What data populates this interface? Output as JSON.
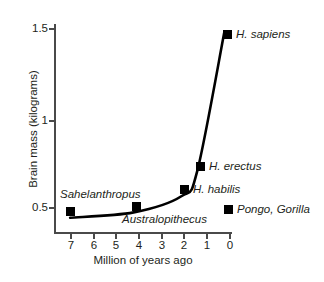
{
  "chart_data": {
    "type": "line",
    "title": "",
    "xlabel": "Million of years ago",
    "ylabel": "Brain mass (kilograms)",
    "xlim": [
      7.6,
      -0.4
    ],
    "ylim": [
      0.33,
      1.58
    ],
    "x_axis_reversed": true,
    "grid": false,
    "legend_position": "inside-lower-right",
    "xticks": [
      {
        "value": 7,
        "label": "7"
      },
      {
        "value": 6,
        "label": "6"
      },
      {
        "value": 5,
        "label": "5"
      },
      {
        "value": 4,
        "label": "4"
      },
      {
        "value": 3,
        "label": "3"
      },
      {
        "value": 2,
        "label": "2"
      },
      {
        "value": 1,
        "label": "1"
      },
      {
        "value": 0,
        "label": "0"
      }
    ],
    "yticks": [
      {
        "value": 1.5,
        "label": "1.5"
      },
      {
        "value": 1.0,
        "label": "1"
      },
      {
        "value": 0.5,
        "label": "0.5"
      }
    ],
    "series": [
      {
        "name": "Hominin brain mass",
        "marker": "filled-square",
        "color": "#000000",
        "points": [
          {
            "x": 7.0,
            "y": 0.44,
            "label": "Sahelanthropus",
            "label_position": "above-right"
          },
          {
            "x": 4.2,
            "y": 0.47,
            "label": "Australopithecus",
            "label_position": "below-right"
          },
          {
            "x": 2.1,
            "y": 0.56,
            "label": "H. habilis",
            "label_position": "right"
          },
          {
            "x": 1.4,
            "y": 0.7,
            "label": "H. erectus",
            "label_position": "right"
          },
          {
            "x": 0.2,
            "y": 1.48,
            "label": "H. sapiens",
            "label_position": "right"
          }
        ]
      }
    ],
    "standalone_markers": [
      {
        "label": "Pongo, Gorilla",
        "marker": "filled-square",
        "color": "#000000"
      }
    ],
    "colors": {
      "axis": "#4a4a4a",
      "text": "#231f20",
      "data": "#000000",
      "background": "#ffffff"
    }
  }
}
